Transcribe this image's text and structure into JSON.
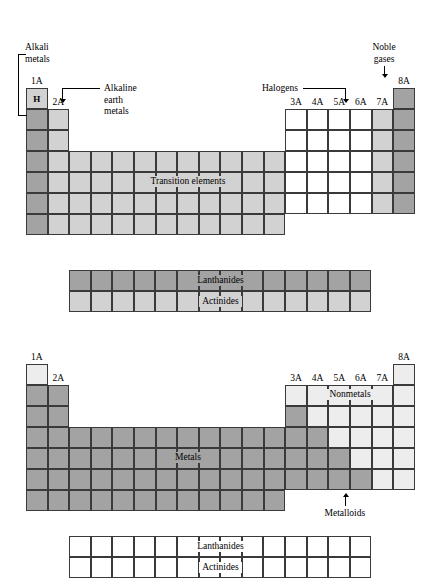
{
  "figure": {
    "colors": {
      "dark_gray": "#a3a3a3",
      "mid_gray": "#b9b9b9",
      "light_gray": "#d2d2d2",
      "pale_gray": "#ededed",
      "white": "#ffffff",
      "line": "#3a3a3a",
      "text": "#000000"
    }
  },
  "table_top": {
    "group_headers": [
      {
        "label": "1A",
        "col": 1
      },
      {
        "label": "2A",
        "col": 2
      },
      {
        "label": "3A",
        "col": 13
      },
      {
        "label": "4A",
        "col": 14
      },
      {
        "label": "5A",
        "col": 15
      },
      {
        "label": "6A",
        "col": 16
      },
      {
        "label": "7A",
        "col": 17
      },
      {
        "label": "8A",
        "col": 18
      }
    ],
    "hydrogen_symbol": "H",
    "captions": {
      "transition": "Transition elements",
      "lanthanides": "Lanthanides",
      "actinides": "Actinides"
    },
    "callouts": {
      "alkali_metals": "Alkali\nmetals",
      "alkali_metals_line1": "Alkali",
      "alkali_metals_line2": "metals",
      "alkaline_earth_line1": "Alkaline",
      "alkaline_earth_line2": "earth",
      "alkaline_earth_line3": "metals",
      "halogens": "Halogens",
      "noble_gases_line1": "Noble",
      "noble_gases_line2": "gases"
    }
  },
  "table_bottom": {
    "group_headers": [
      {
        "label": "1A",
        "col": 1
      },
      {
        "label": "2A",
        "col": 2
      },
      {
        "label": "3A",
        "col": 13
      },
      {
        "label": "4A",
        "col": 14
      },
      {
        "label": "5A",
        "col": 15
      },
      {
        "label": "6A",
        "col": 16
      },
      {
        "label": "7A",
        "col": 17
      },
      {
        "label": "8A",
        "col": 18
      }
    ],
    "captions": {
      "metals": "Metals",
      "nonmetals": "Nonmetals",
      "lanthanides": "Lanthanides",
      "actinides": "Actinides"
    },
    "callouts": {
      "metalloids": "Metalloids"
    }
  }
}
